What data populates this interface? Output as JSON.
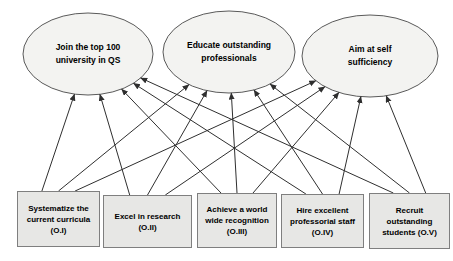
{
  "diagram": {
    "type": "goal-objective-map",
    "goals": [
      {
        "id": "G1",
        "label_lines": [
          "Join the top 100",
          "university in QS"
        ]
      },
      {
        "id": "G2",
        "label_lines": [
          "Educate outstanding",
          "professionals"
        ]
      },
      {
        "id": "G3",
        "label_lines": [
          "Aim at self",
          "sufficiency"
        ]
      }
    ],
    "objectives": [
      {
        "id": "O.I",
        "label": "Systematize the current curricula (O.I)"
      },
      {
        "id": "O.II",
        "label": "Excel in research (O.II)"
      },
      {
        "id": "O.III",
        "label": "Achieve a world wide recognition (O.III)"
      },
      {
        "id": "O.IV",
        "label": "Hire excellent professorial staff (O.IV)"
      },
      {
        "id": "O.V",
        "label": "Recruit outstanding students (O.V)"
      }
    ],
    "edges": [
      {
        "from": "O.I",
        "to": "G1"
      },
      {
        "from": "O.I",
        "to": "G2"
      },
      {
        "from": "O.I",
        "to": "G3"
      },
      {
        "from": "O.II",
        "to": "G1"
      },
      {
        "from": "O.II",
        "to": "G2"
      },
      {
        "from": "O.II",
        "to": "G3"
      },
      {
        "from": "O.III",
        "to": "G1"
      },
      {
        "from": "O.III",
        "to": "G2"
      },
      {
        "from": "O.III",
        "to": "G3"
      },
      {
        "from": "O.IV",
        "to": "G1"
      },
      {
        "from": "O.IV",
        "to": "G2"
      },
      {
        "from": "O.IV",
        "to": "G3"
      },
      {
        "from": "O.V",
        "to": "G1"
      },
      {
        "from": "O.V",
        "to": "G2"
      },
      {
        "from": "O.V",
        "to": "G3"
      }
    ],
    "colors": {
      "ellipse_fill": "#f3f3f1",
      "ellipse_stroke": "#5a5a5a",
      "box_fill": "#e7e7e5",
      "box_border": "#7f7f7f",
      "arrow": "#2f2f2f",
      "text": "#000000"
    }
  }
}
